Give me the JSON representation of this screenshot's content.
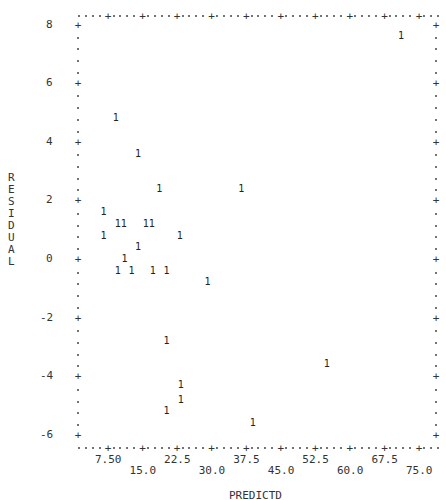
{
  "chart_data": {
    "type": "scatter",
    "title": "",
    "xlabel": "PREDICTD",
    "ylabel": "RESIDUAL",
    "xlim": [
      0,
      78.75
    ],
    "ylim": [
      -6.4,
      8.4
    ],
    "grid": false,
    "legend": null,
    "plot_symbol": "1",
    "x_ticks": [
      7.5,
      15.0,
      22.5,
      30.0,
      37.5,
      45.0,
      52.5,
      60.0,
      67.5,
      75.0
    ],
    "x_tick_labels_upper": [
      "7.50",
      "22.5",
      "37.5",
      "52.5",
      "67.5"
    ],
    "x_tick_labels_lower": [
      "15.0",
      "30.0",
      "45.0",
      "60.0",
      "75.0"
    ],
    "y_ticks": [
      8,
      6,
      4,
      2,
      0,
      -2,
      -4,
      -6
    ],
    "y_tick_labels": [
      "8",
      "6",
      "4",
      "2",
      "0",
      "-2",
      "-4",
      "-6"
    ],
    "series": [
      {
        "name": "1",
        "points": [
          {
            "x": 71.1,
            "y": 7.6
          },
          {
            "x": 9.2,
            "y": 4.8
          },
          {
            "x": 14.0,
            "y": 3.6
          },
          {
            "x": 18.6,
            "y": 2.4
          },
          {
            "x": 36.4,
            "y": 2.4
          },
          {
            "x": 6.5,
            "y": 1.6
          },
          {
            "x": 9.6,
            "y": 1.2
          },
          {
            "x": 10.9,
            "y": 1.2
          },
          {
            "x": 15.7,
            "y": 1.2
          },
          {
            "x": 17.0,
            "y": 1.2
          },
          {
            "x": 6.5,
            "y": 0.8
          },
          {
            "x": 23.1,
            "y": 0.8
          },
          {
            "x": 14.0,
            "y": 0.4
          },
          {
            "x": 11.1,
            "y": 0.0
          },
          {
            "x": 9.6,
            "y": -0.4
          },
          {
            "x": 12.6,
            "y": -0.4
          },
          {
            "x": 17.2,
            "y": -0.4
          },
          {
            "x": 20.2,
            "y": -0.4
          },
          {
            "x": 29.1,
            "y": -0.8
          },
          {
            "x": 20.2,
            "y": -2.8
          },
          {
            "x": 55.0,
            "y": -3.6
          },
          {
            "x": 23.3,
            "y": -4.3
          },
          {
            "x": 23.3,
            "y": -4.8
          },
          {
            "x": 20.2,
            "y": -5.2
          },
          {
            "x": 38.9,
            "y": -5.6
          }
        ]
      }
    ]
  },
  "axes": {
    "x_title": "PREDICTD",
    "y_title_letters": [
      "R",
      "E",
      "S",
      "I",
      "D",
      "U",
      "A",
      "L"
    ]
  }
}
